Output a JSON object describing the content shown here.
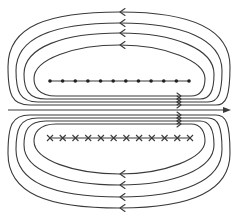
{
  "diagram": {
    "title": "",
    "colors": {
      "line": "#3a3a3a",
      "background": "#ffffff",
      "marker": "#222222"
    },
    "axis": {
      "y": 110,
      "x_start": 8,
      "x_end": 231,
      "direction": "right"
    },
    "top_loops": [
      {
        "id": "top-loop-1",
        "left": 8,
        "right": 230,
        "top": 12,
        "bottom": 105,
        "arrow_x": 120,
        "arrow_direction": "left"
      },
      {
        "id": "top-loop-2",
        "left": 16,
        "right": 222,
        "top": 23,
        "bottom": 102,
        "arrow_x": 120,
        "arrow_direction": "left"
      },
      {
        "id": "top-loop-3",
        "left": 24,
        "right": 214,
        "top": 33,
        "bottom": 99,
        "arrow_x": 120,
        "arrow_direction": "left"
      },
      {
        "id": "top-loop-4",
        "left": 34,
        "right": 205,
        "top": 45,
        "bottom": 96,
        "arrow_x": 120,
        "arrow_direction": "left"
      }
    ],
    "bottom_loops": [
      {
        "id": "bottom-loop-1",
        "left": 8,
        "right": 230,
        "top": 115,
        "bottom": 208,
        "arrow_x": 120,
        "arrow_direction": "left"
      },
      {
        "id": "bottom-loop-2",
        "left": 16,
        "right": 222,
        "top": 118,
        "bottom": 197,
        "arrow_x": 120,
        "arrow_direction": "left"
      },
      {
        "id": "bottom-loop-3",
        "left": 24,
        "right": 214,
        "top": 121,
        "bottom": 185,
        "arrow_x": 120,
        "arrow_direction": "left"
      },
      {
        "id": "bottom-loop-4",
        "left": 34,
        "right": 205,
        "top": 124,
        "bottom": 174,
        "arrow_x": 120,
        "arrow_direction": "left"
      }
    ],
    "inner_arrow_x": 181,
    "dot_row": {
      "y": 81,
      "x_start": 50,
      "x_end": 189,
      "count": 12,
      "symbol": "dot",
      "meaning": "current out of page"
    },
    "cross_row": {
      "y": 138,
      "x_start": 50,
      "x_end": 190,
      "count": 12,
      "symbol": "cross",
      "meaning": "current into page"
    }
  }
}
